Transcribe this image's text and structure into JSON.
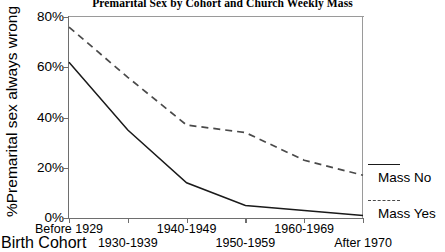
{
  "chart_data": {
    "type": "line",
    "title": "Premarital Sex by Cohort and Church Weekly Mass",
    "xlabel": "Birth Cohort",
    "ylabel": "%Premarital sex always wrong",
    "categories": [
      "Before 1929",
      "1930-1939",
      "1940-1949",
      "1950-1959",
      "1960-1969",
      "After 1970"
    ],
    "ylim": [
      0,
      80
    ],
    "yticks": [
      0,
      20,
      40,
      60,
      80
    ],
    "ytick_labels": [
      "0%",
      "20%",
      "40%",
      "60%",
      "80%"
    ],
    "grid": false,
    "legend_position": "right",
    "series": [
      {
        "name": "Mass No",
        "style": "solid",
        "color": "#1a1a1a",
        "values": [
          62,
          35,
          14,
          5,
          3,
          1
        ]
      },
      {
        "name": "Mass Yes",
        "style": "dashed",
        "color": "#4a4a4a",
        "values": [
          76,
          56,
          37,
          34,
          23,
          17
        ]
      }
    ]
  }
}
